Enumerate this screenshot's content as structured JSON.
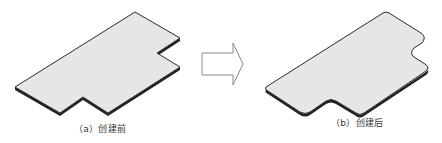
{
  "figure": {
    "panels": [
      {
        "id": "a",
        "caption": "（a）创建前",
        "description": "flat sheet-metal plate with sharp rectangular notches"
      },
      {
        "id": "b",
        "caption": "（b）创建后",
        "description": "flat sheet-metal plate with rounded (filleted) corners and notches"
      }
    ],
    "arrow": {
      "direction": "right",
      "style": "outline"
    }
  },
  "colors": {
    "plate_fill": "#e6e6e6",
    "plate_edge": "#2b2b2b",
    "arrow_stroke": "#8a8a8a",
    "caption_text": "#333333"
  }
}
